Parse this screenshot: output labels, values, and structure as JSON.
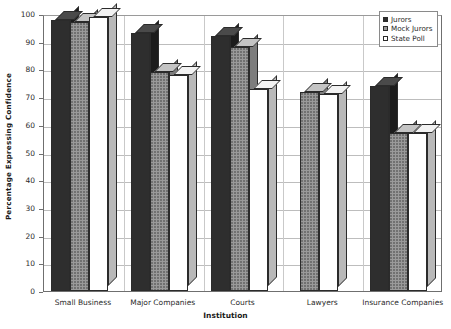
{
  "chart_data": {
    "type": "bar",
    "title": "",
    "xlabel": "Institution",
    "ylabel": "Percentage Expressing Confidence",
    "ylim": [
      0,
      100
    ],
    "ytick_step": 10,
    "yticks": [
      "100",
      "90",
      "80",
      "70",
      "60",
      "50",
      "40",
      "30",
      "20",
      "10",
      "0"
    ],
    "grid": true,
    "legend_position": "top-right",
    "style": "3d-grouped-bars",
    "categories": [
      "Small Business",
      "Major Companies",
      "Courts",
      "Lawyers",
      "Insurance Companies"
    ],
    "series": [
      {
        "name": "Jurors",
        "color": "#2e2e2e",
        "values": [
          98,
          93,
          92,
          null,
          74
        ]
      },
      {
        "name": "Mock Jurors",
        "color": "#9a9a9a",
        "values": [
          97,
          79,
          88,
          72,
          57
        ]
      },
      {
        "name": "State Poll",
        "color": "#ffffff",
        "values": [
          99,
          78,
          73,
          71,
          57
        ]
      }
    ]
  },
  "legend": {
    "items": [
      {
        "label": "Jurors"
      },
      {
        "label": "Mock Jurors"
      },
      {
        "label": "State Poll"
      }
    ]
  }
}
